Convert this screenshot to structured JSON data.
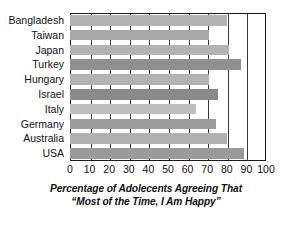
{
  "chart_data": {
    "type": "bar",
    "orientation": "horizontal",
    "title_lines": [
      "Percentage of Adolecents Agreeing That",
      "“Most of the Time, I Am Happy”"
    ],
    "xlabel": "Percentage of Adolecents Agreeing That \"Most of the Time, I Am Happy\"",
    "ylabel": "",
    "categories": [
      "Bangladesh",
      "Taiwan",
      "Japan",
      "Turkey",
      "Hungary",
      "Israel",
      "Italy",
      "Germany",
      "Australia",
      "USA"
    ],
    "values": [
      80,
      71,
      81,
      87,
      71,
      75.5,
      64.5,
      74.5,
      80,
      89
    ],
    "xlim": [
      0,
      100
    ],
    "xticks": [
      0,
      10,
      20,
      30,
      40,
      50,
      60,
      70,
      80,
      90,
      100
    ],
    "xtick_labels": [
      "0",
      "10",
      "20",
      "30",
      "40",
      "50",
      "60",
      "70",
      "80",
      "90",
      "100"
    ],
    "grid": true,
    "grid_axis": "x",
    "legend": false,
    "bar_colors": [
      "#b3b3b3",
      "#a8a8a8",
      "#b3b3b3",
      "#8f8f8f",
      "#b3b3b3",
      "#8a8a8a",
      "#bdbdbd",
      "#9c9c9c",
      "#b0b0b0",
      "#9a9a9a"
    ],
    "axis_color": "#1a1a1a",
    "grid_color": "#3a3a3a",
    "background": "#ffffff"
  }
}
